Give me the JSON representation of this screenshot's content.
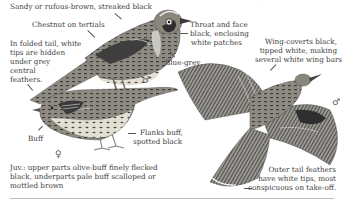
{
  "plate": {
    "subject": "Lark / pipit-like bird identification plate",
    "faint_top_text": "..."
  },
  "labels": {
    "upperparts": "Sandy or rufous-brown, streaked black",
    "tertials": "Chestnut on tertials",
    "folded_tail": [
      "In folded tail, white",
      "tips are hidden",
      "under grey",
      "central",
      "feathers."
    ],
    "throat": [
      "Throat and face",
      "black, enclosing",
      "white patches"
    ],
    "blue_grey": "Blue-grey",
    "wing_coverts": [
      "Wing-coverts black,",
      "tipped white, making",
      "several white wing bars"
    ],
    "buff": "Buff",
    "flanks": [
      "Flanks buff,",
      "spotted black"
    ],
    "juvenile": [
      "Juv.: upper parts olive-buff finely flecked",
      "black, underparts pale buff scalloped or",
      "mottled brown"
    ],
    "outer_tail": [
      "Outer tail feathers",
      "have white tips, most",
      "conspicuous on take-off."
    ]
  },
  "symbols": {
    "male_perched": "♂",
    "female": "♀",
    "male_flight": "♂"
  },
  "colors": {
    "plumage_dark": "#4a4a4a",
    "plumage_mid": "#8a8a84",
    "plumage_light": "#c9c4b8",
    "breast": "#e6e2d8",
    "rule": "#bdbdbd"
  }
}
